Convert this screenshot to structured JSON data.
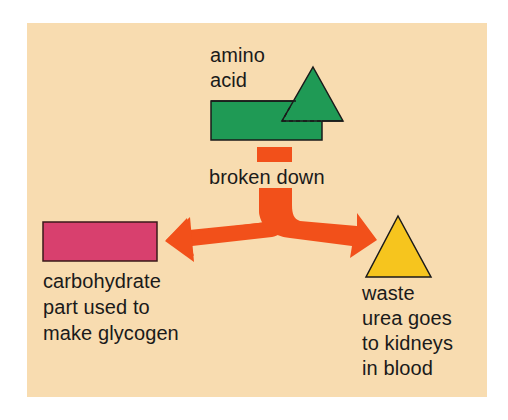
{
  "diagram": {
    "background_color": "#f8dcb0",
    "colors": {
      "amino_acid": "#1f9a55",
      "carbohydrate": "#d8406e",
      "arrow": "#f2501a",
      "waste": "#f6c51e",
      "outline": "#1a1a1a",
      "text": "#1a1a1a"
    },
    "nodes": {
      "amino_acid": {
        "label": "amino\nacid",
        "shape": "rectangle + triangle (green)"
      },
      "process": {
        "label": "broken down"
      },
      "carbohydrate": {
        "label": "carbohydrate\npart used to\nmake glycogen",
        "shape": "rectangle (pink)"
      },
      "waste": {
        "label": "waste\nurea goes\nto kidneys\nin blood",
        "shape": "triangle (yellow)"
      }
    },
    "edges": [
      {
        "from": "amino_acid",
        "to": "process",
        "style": "orange bar"
      },
      {
        "from": "process",
        "to": "carbohydrate",
        "style": "orange forked arrow"
      },
      {
        "from": "process",
        "to": "waste",
        "style": "orange forked arrow"
      }
    ]
  }
}
